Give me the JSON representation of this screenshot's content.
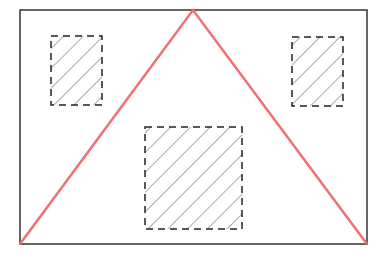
{
  "diagram": {
    "type": "geometric-layout",
    "colors": {
      "frame": "#333333",
      "triangle": "#f07070",
      "box_border": "#222222",
      "hatch": "#555555",
      "background": "#ffffff"
    },
    "frame": {
      "x": 20,
      "y": 10,
      "width": 347,
      "height": 234
    },
    "triangle": {
      "apex": [
        193,
        10
      ],
      "left": [
        20,
        244
      ],
      "right": [
        367,
        244
      ]
    },
    "boxes": [
      {
        "name": "top-left",
        "x": 51,
        "y": 36,
        "width": 51,
        "height": 69
      },
      {
        "name": "top-right",
        "x": 292,
        "y": 37,
        "width": 51,
        "height": 69
      },
      {
        "name": "bottom-center",
        "x": 145,
        "y": 127,
        "width": 97,
        "height": 102
      }
    ]
  }
}
